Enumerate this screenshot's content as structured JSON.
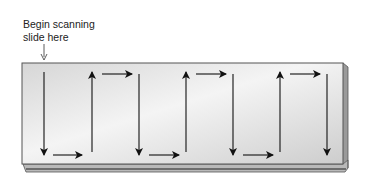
{
  "caption": {
    "line1": "Begin scanning",
    "line2": "slide here"
  },
  "slide": {
    "fill_light": "#f2f2f2",
    "fill_dark": "#cfcfcf",
    "edge_color": "#555555"
  },
  "scan_path": {
    "direction_sequence": [
      "down",
      "right",
      "up",
      "right",
      "down",
      "right",
      "up",
      "right",
      "down",
      "right",
      "up",
      "right",
      "down"
    ],
    "vertical_columns": 7,
    "arrow_color": "#111111"
  }
}
